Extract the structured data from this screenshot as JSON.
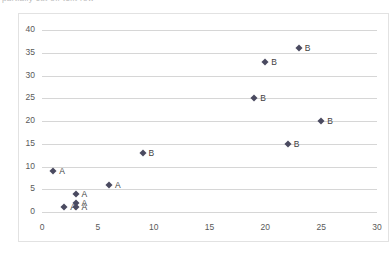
{
  "header": {
    "clipped_text": "partially cut off text row"
  },
  "chart_data": {
    "type": "scatter",
    "title": "",
    "xlabel": "",
    "ylabel": "",
    "xlim": [
      0,
      30
    ],
    "ylim": [
      0,
      40
    ],
    "xticks": [
      0,
      5,
      10,
      15,
      20,
      25,
      30
    ],
    "yticks": [
      0,
      5,
      10,
      15,
      20,
      25,
      30,
      35,
      40
    ],
    "grid": "horizontal",
    "legend": "none",
    "marker_color": "#4a4a60",
    "marker_shape": "diamond",
    "gridline_color": "#d6d6d6",
    "points": [
      {
        "x": 1,
        "y": 9,
        "label": "A"
      },
      {
        "x": 2,
        "y": 1,
        "label": "A"
      },
      {
        "x": 3,
        "y": 4,
        "label": "A"
      },
      {
        "x": 3,
        "y": 2,
        "label": "A"
      },
      {
        "x": 3,
        "y": 1,
        "label": "A"
      },
      {
        "x": 6,
        "y": 6,
        "label": "A"
      },
      {
        "x": 9,
        "y": 13,
        "label": "B"
      },
      {
        "x": 19,
        "y": 25,
        "label": "B"
      },
      {
        "x": 20,
        "y": 33,
        "label": "B"
      },
      {
        "x": 22,
        "y": 15,
        "label": "B"
      },
      {
        "x": 23,
        "y": 36,
        "label": "B"
      },
      {
        "x": 25,
        "y": 20,
        "label": "B"
      }
    ],
    "series": [
      {
        "name": "A",
        "x": [
          1,
          2,
          3,
          3,
          3,
          6
        ],
        "values": [
          9,
          1,
          4,
          2,
          1,
          6
        ]
      },
      {
        "name": "B",
        "x": [
          9,
          19,
          20,
          22,
          23,
          25
        ],
        "values": [
          13,
          25,
          33,
          15,
          36,
          20
        ]
      }
    ]
  }
}
